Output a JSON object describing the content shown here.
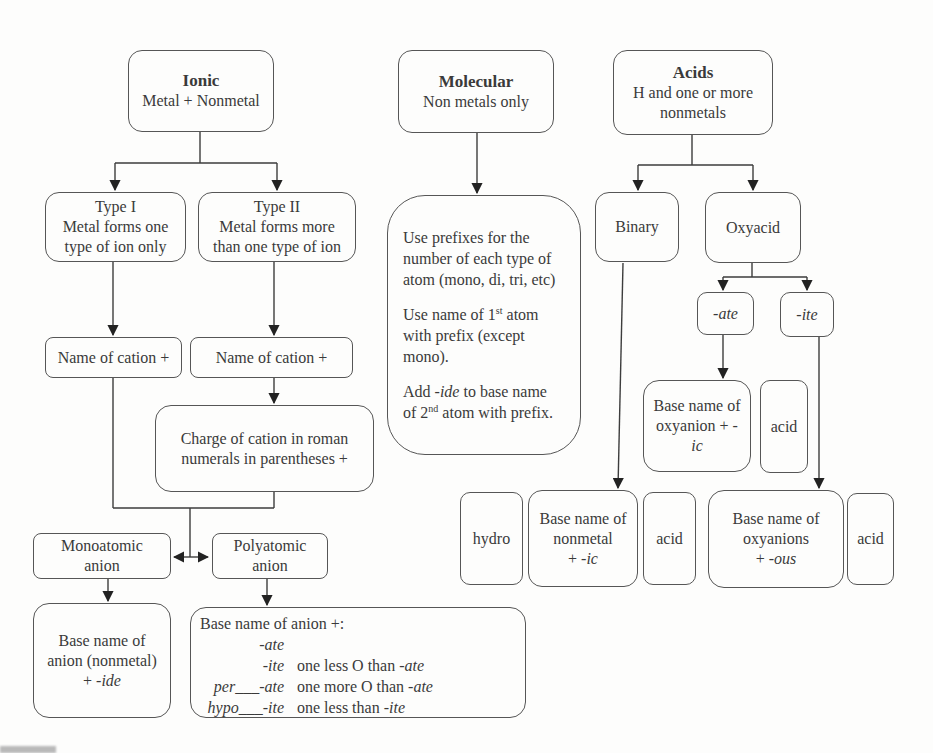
{
  "colors": {
    "line": "#3d3d3d",
    "border": "#565656",
    "text": "#3a3a3a",
    "background": "#fdfdfc"
  },
  "nodes": {
    "ionic": {
      "title": "Ionic",
      "subtitle": "Metal + Nonmetal"
    },
    "molecular": {
      "title": "Molecular",
      "subtitle": "Non metals only"
    },
    "acids": {
      "title": "Acids",
      "line2": "H and one or more",
      "line3": "nonmetals"
    },
    "type1": {
      "line1": "Type I",
      "line2": "Metal forms one",
      "line3": "type of ion only"
    },
    "type2": {
      "line1": "Type II",
      "line2": "Metal forms more",
      "line3": "than one type of ion"
    },
    "binary": {
      "text": "Binary"
    },
    "oxyacid": {
      "text": "Oxyacid"
    },
    "name_cation_left": {
      "text": "Name of cation +"
    },
    "name_cation_right": {
      "text": "Name of cation +"
    },
    "molecular_rules": {
      "p1_l1": "Use prefixes for the",
      "p1_l2": "number of each type of",
      "p1_l3": "atom (mono, di, tri, etc)",
      "p2_l1_a": "Use name of 1",
      "p2_l1_sup": "st",
      "p2_l1_b": " atom",
      "p2_l2": "with prefix (except",
      "p2_l3": "mono).",
      "p3_l1_a": "Add ",
      "p3_l1_it": "-ide",
      "p3_l1_b": " to base name",
      "p3_l2_a": "of 2",
      "p3_l2_sup": "nd",
      "p3_l2_b": " atom with prefix."
    },
    "ate": {
      "text": "-ate"
    },
    "ite": {
      "text": "-ite"
    },
    "charge": {
      "line1": "Charge of cation in roman",
      "line2": "numerals in parentheses +"
    },
    "oxyanion_ic": {
      "line1": "Base name of",
      "line2": "oxyanion + -",
      "line3_it": "ic"
    },
    "acid_top": {
      "text": "acid"
    },
    "monoatomic": {
      "line1": "Monoatomic",
      "line2": "anion"
    },
    "polyatomic": {
      "line1": "Polyatomic",
      "line2": "anion"
    },
    "hydro": {
      "text": "hydro"
    },
    "nonmetal_ic": {
      "line1": "Base name of",
      "line2": "nonmetal",
      "plus": "+ ",
      "suffix_it": "-ic"
    },
    "acid_mid": {
      "text": "acid"
    },
    "oxyanions_ous": {
      "line1": "Base name of",
      "line2": "oxyanions",
      "plus": "+ ",
      "suffix_it": "-ous"
    },
    "acid_right": {
      "text": "acid"
    },
    "anion_ide": {
      "line1": "Base name of",
      "line2": "anion (nonmetal)",
      "plus": "+ ",
      "suffix_it": "-ide"
    },
    "anion_rules": {
      "header": "Base name of anion +:",
      "rows": [
        {
          "pre": "",
          "suffix": "-ate",
          "desc_plain": "",
          "desc_it": ""
        },
        {
          "pre": "",
          "suffix": "-ite",
          "desc_plain": "one less O than ",
          "desc_it": "-ate"
        },
        {
          "pre": "per___",
          "suffix": "-ate",
          "desc_plain": "one more O than ",
          "desc_it": "-ate"
        },
        {
          "pre": "hypo___",
          "suffix": "-ite",
          "desc_plain": "one less than ",
          "desc_it": "-ite"
        }
      ]
    }
  }
}
